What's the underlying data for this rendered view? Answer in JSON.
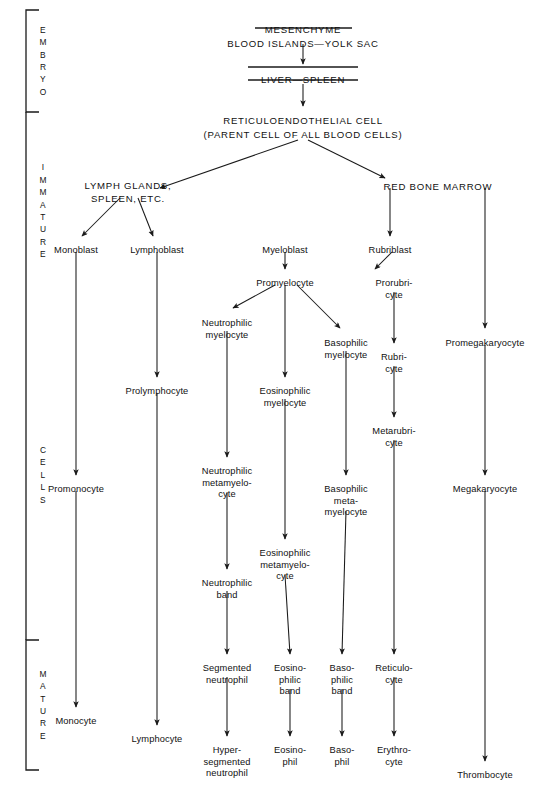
{
  "stage_brackets": [
    {
      "name": "embryo",
      "label": "E\nM\nB\nR\nY\nO",
      "x": 26,
      "y_top": 10,
      "y_bottom": 112,
      "capped": true
    },
    {
      "name": "immature",
      "label": "I\nM\nM\nA\nT\nU\nR\nE",
      "x": 26,
      "y_top": 112,
      "y_bottom": 310,
      "capped": false
    },
    {
      "name": "cells",
      "label": "C\nE\nL\nL\nS",
      "x": 26,
      "y_top": 310,
      "y_bottom": 640,
      "capped": false
    },
    {
      "name": "mature",
      "label": "M\nA\nT\nU\nR\nE",
      "x": 26,
      "y_top": 640,
      "y_bottom": 770,
      "capped": true
    }
  ],
  "nodes": [
    {
      "id": "mesenchyme",
      "label": "MESENCHYME",
      "x": 303,
      "y": 24,
      "style": "caps",
      "rule": "under"
    },
    {
      "id": "blood-islands",
      "label": "BLOOD ISLANDS—YOLK SAC",
      "x": 303,
      "y": 38,
      "style": "caps",
      "rule": "none"
    },
    {
      "id": "liver-spleen",
      "label": "LIVER—SPLEEN",
      "x": 303,
      "y": 74,
      "style": "caps",
      "rule": "both"
    },
    {
      "id": "reticulo-cell",
      "label": "RETICULOENDOTHELIAL CELL",
      "x": 303,
      "y": 115,
      "style": "caps",
      "rule": "none"
    },
    {
      "id": "parent-cell",
      "label": "(PARENT CELL OF ALL BLOOD CELLS)",
      "x": 303,
      "y": 129,
      "style": "caps",
      "rule": "none"
    },
    {
      "id": "lymph-glands",
      "label": "LYMPH GLANDS,\nSPLEEN, ETC.",
      "x": 128,
      "y": 180,
      "style": "caps",
      "rule": "none"
    },
    {
      "id": "red-bone-marrow",
      "label": "RED BONE MARROW",
      "x": 438,
      "y": 181,
      "style": "caps",
      "rule": "none"
    },
    {
      "id": "monoblast",
      "label": "Monoblast",
      "x": 76,
      "y": 245
    },
    {
      "id": "lymphoblast",
      "label": "Lymphoblast",
      "x": 157,
      "y": 245
    },
    {
      "id": "myeloblast",
      "label": "Myeloblast",
      "x": 285,
      "y": 245
    },
    {
      "id": "rubriblast",
      "label": "Rubriblast",
      "x": 390,
      "y": 245
    },
    {
      "id": "promyelocyte",
      "label": "Promyelocyte",
      "x": 285,
      "y": 278
    },
    {
      "id": "prorubricyte",
      "label": "Prorubri-\ncyte",
      "x": 394,
      "y": 278
    },
    {
      "id": "neutrophilic-myelocyte",
      "label": "Neutrophilic\nmyelocyte",
      "x": 227,
      "y": 318
    },
    {
      "id": "basophilic-myelocyte",
      "label": "Basophilic\nmyelocyte",
      "x": 346,
      "y": 338
    },
    {
      "id": "rubricyte",
      "label": "Rubri-\ncyte",
      "x": 394,
      "y": 352
    },
    {
      "id": "promegakaryocyte",
      "label": "Promegakaryocyte",
      "x": 485,
      "y": 338
    },
    {
      "id": "prolymphocyte",
      "label": "Prolymphocyte",
      "x": 157,
      "y": 386
    },
    {
      "id": "eosinophilic-myelocyte",
      "label": "Eosinophilic\nmyelocyte",
      "x": 285,
      "y": 386
    },
    {
      "id": "metarubricyte",
      "label": "Metarubri-\ncyte",
      "x": 394,
      "y": 426
    },
    {
      "id": "promonocyte",
      "label": "Promonocyte",
      "x": 76,
      "y": 484
    },
    {
      "id": "neutrophilic-metamyelo",
      "label": "Neutrophilic\nmetamyelo-\ncyte",
      "x": 227,
      "y": 466
    },
    {
      "id": "basophilic-metamyelo",
      "label": "Basophilic\nmeta-\nmyelocyte",
      "x": 346,
      "y": 484
    },
    {
      "id": "megakaryocyte",
      "label": "Megakaryocyte",
      "x": 485,
      "y": 484
    },
    {
      "id": "eosinophilic-metamyelo",
      "label": "Eosinophilic\nmetamyelo-\ncyte",
      "x": 285,
      "y": 548
    },
    {
      "id": "neutrophilic-band",
      "label": "Neutrophilic\nband",
      "x": 227,
      "y": 578
    },
    {
      "id": "segmented-neutrophil",
      "label": "Segmented\nneutrophil",
      "x": 227,
      "y": 663
    },
    {
      "id": "eosinophilic-band",
      "label": "Eosino-\nphilic\nband",
      "x": 290,
      "y": 663
    },
    {
      "id": "basophilic-band",
      "label": "Baso-\nphilic\nband",
      "x": 342,
      "y": 663
    },
    {
      "id": "reticulocyte",
      "label": "Reticulo-\ncyte",
      "x": 394,
      "y": 663
    },
    {
      "id": "monocyte",
      "label": "Monocyte",
      "x": 76,
      "y": 716
    },
    {
      "id": "lymphocyte",
      "label": "Lymphocyte",
      "x": 157,
      "y": 734
    },
    {
      "id": "hypersegmented-neutrophil",
      "label": "Hyper-\nsegmented\nneutrophil",
      "x": 227,
      "y": 745
    },
    {
      "id": "eosinophil",
      "label": "Eosino-\nphil",
      "x": 290,
      "y": 745
    },
    {
      "id": "basophil",
      "label": "Baso-\nphil",
      "x": 342,
      "y": 745
    },
    {
      "id": "erythrocyte",
      "label": "Erythro-\ncyte",
      "x": 394,
      "y": 745
    },
    {
      "id": "thrombocyte",
      "label": "Thrombocyte",
      "x": 485,
      "y": 770
    }
  ],
  "rules": [
    {
      "name": "mesenchyme-underline",
      "x1": 255,
      "x2": 352,
      "y": 28
    },
    {
      "name": "liver-spleen-overline",
      "x1": 248,
      "x2": 358,
      "y": 67
    },
    {
      "name": "liver-spleen-underline",
      "x1": 248,
      "x2": 358,
      "y": 80
    }
  ],
  "edges": [
    {
      "name": "blood-islands-to-liver",
      "type": "arrow",
      "x1": 303,
      "y1": 44,
      "x2": 303,
      "y2": 64
    },
    {
      "name": "liver-to-reticulo",
      "type": "arrow",
      "x1": 303,
      "y1": 84,
      "x2": 303,
      "y2": 106
    },
    {
      "name": "reticulo-to-lymph",
      "type": "arrow",
      "x1": 298,
      "y1": 140,
      "x2": 160,
      "y2": 188
    },
    {
      "name": "reticulo-to-marrow",
      "type": "arrow",
      "x1": 308,
      "y1": 140,
      "x2": 385,
      "y2": 178
    },
    {
      "name": "lymph-to-monoblast",
      "type": "arrow",
      "x1": 120,
      "y1": 198,
      "x2": 82,
      "y2": 236
    },
    {
      "name": "lymph-to-lymphoblast",
      "type": "arrow",
      "x1": 138,
      "y1": 198,
      "x2": 153,
      "y2": 236
    },
    {
      "name": "marrow-to-rubriblast",
      "type": "arrow",
      "x1": 390,
      "y1": 188,
      "x2": 390,
      "y2": 236
    },
    {
      "name": "marrow-to-promegakaryocyte",
      "type": "arrow",
      "x1": 485,
      "y1": 188,
      "x2": 485,
      "y2": 328
    },
    {
      "name": "monoblast-to-promonocyte",
      "type": "arrow",
      "x1": 76,
      "y1": 252,
      "x2": 76,
      "y2": 475
    },
    {
      "name": "lymphoblast-to-prolymph",
      "type": "arrow",
      "x1": 157,
      "y1": 252,
      "x2": 157,
      "y2": 377
    },
    {
      "name": "myeloblast-to-promyelocyte",
      "type": "arrow",
      "x1": 285,
      "y1": 252,
      "x2": 285,
      "y2": 269
    },
    {
      "name": "rubriblast-to-prorubricyte",
      "type": "arrow",
      "x1": 392,
      "y1": 252,
      "x2": 375,
      "y2": 269
    },
    {
      "name": "promyelocyte-to-neutro-myelo",
      "type": "arrow",
      "x1": 275,
      "y1": 285,
      "x2": 233,
      "y2": 308
    },
    {
      "name": "promyelocyte-to-eosino-myelo",
      "type": "arrow",
      "x1": 285,
      "y1": 285,
      "x2": 285,
      "y2": 377
    },
    {
      "name": "promyelocyte-to-baso-myelo",
      "type": "arrow",
      "x1": 297,
      "y1": 285,
      "x2": 340,
      "y2": 328
    },
    {
      "name": "prorubricyte-to-rubricyte",
      "type": "arrow",
      "x1": 394,
      "y1": 292,
      "x2": 394,
      "y2": 343
    },
    {
      "name": "neutro-myelo-to-metamyelo",
      "type": "arrow",
      "x1": 227,
      "y1": 331,
      "x2": 227,
      "y2": 457
    },
    {
      "name": "baso-myelo-to-metamyelo",
      "type": "arrow",
      "x1": 346,
      "y1": 351,
      "x2": 346,
      "y2": 475
    },
    {
      "name": "rubricyte-to-metarubricyte",
      "type": "arrow",
      "x1": 394,
      "y1": 366,
      "x2": 394,
      "y2": 417
    },
    {
      "name": "promegakaryocyte-to-megakaryocyte",
      "type": "arrow",
      "x1": 485,
      "y1": 345,
      "x2": 485,
      "y2": 475
    },
    {
      "name": "prolymphocyte-to-lymphocyte",
      "type": "arrow",
      "x1": 157,
      "y1": 393,
      "x2": 157,
      "y2": 725
    },
    {
      "name": "eosino-myelo-to-metamyelo",
      "type": "arrow",
      "x1": 285,
      "y1": 399,
      "x2": 285,
      "y2": 539
    },
    {
      "name": "metarubricyte-to-reticulocyte",
      "type": "arrow",
      "x1": 394,
      "y1": 440,
      "x2": 394,
      "y2": 654
    },
    {
      "name": "promonocyte-to-monocyte",
      "type": "arrow",
      "x1": 76,
      "y1": 491,
      "x2": 76,
      "y2": 707
    },
    {
      "name": "neutro-metamyelo-to-band",
      "type": "arrow",
      "x1": 227,
      "y1": 493,
      "x2": 227,
      "y2": 569
    },
    {
      "name": "baso-metamyelo-to-band",
      "type": "arrow",
      "x1": 346,
      "y1": 511,
      "x2": 342,
      "y2": 654
    },
    {
      "name": "megakaryocyte-to-thrombocyte",
      "type": "arrow",
      "x1": 485,
      "y1": 491,
      "x2": 485,
      "y2": 761
    },
    {
      "name": "eosino-metamyelo-to-band",
      "type": "arrow",
      "x1": 285,
      "y1": 575,
      "x2": 290,
      "y2": 654
    },
    {
      "name": "neutro-band-to-segmented",
      "type": "arrow",
      "x1": 227,
      "y1": 591,
      "x2": 227,
      "y2": 654
    },
    {
      "name": "segmented-to-hyper",
      "type": "arrow",
      "x1": 227,
      "y1": 677,
      "x2": 227,
      "y2": 736
    },
    {
      "name": "eosino-band-to-eosinophil",
      "type": "arrow",
      "x1": 290,
      "y1": 689,
      "x2": 290,
      "y2": 736
    },
    {
      "name": "baso-band-to-basophil",
      "type": "arrow",
      "x1": 342,
      "y1": 689,
      "x2": 342,
      "y2": 736
    },
    {
      "name": "reticulocyte-to-erythrocyte",
      "type": "arrow",
      "x1": 394,
      "y1": 677,
      "x2": 394,
      "y2": 736
    }
  ],
  "colors": {
    "ink": "#111111",
    "paper": "#ffffff"
  }
}
